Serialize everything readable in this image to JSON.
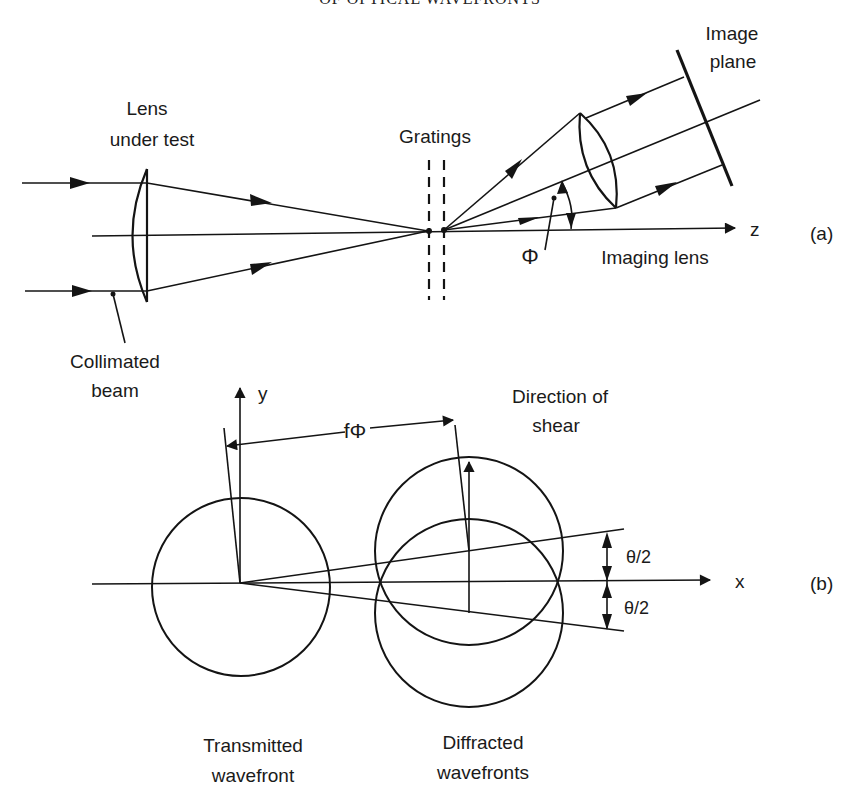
{
  "header": {
    "text": "OF OPTICAL WAVEFRONTS"
  },
  "part_a": {
    "panel_label": "(a)",
    "labels": {
      "lens_under_test_line1": "Lens",
      "lens_under_test_line2": "under test",
      "gratings": "Gratings",
      "image_plane_line1": "Image",
      "image_plane_line2": "plane",
      "axis_z": "z",
      "phi": "Φ",
      "imaging_lens": "Imaging lens",
      "collimated_beam_line1": "Collimated",
      "collimated_beam_line2": "beam"
    }
  },
  "part_b": {
    "panel_label": "(b)",
    "labels": {
      "axis_y": "y",
      "axis_x": "x",
      "f_phi": "fΦ",
      "direction_of_shear_line1": "Direction of",
      "direction_of_shear_line2": "shear",
      "theta_half_upper": "θ/2",
      "theta_half_lower": "θ/2",
      "transmitted_line1": "Transmitted",
      "transmitted_line2": "wavefront",
      "diffracted_line1": "Diffracted",
      "diffracted_line2": "wavefronts"
    }
  },
  "colors": {
    "ink": "#141414",
    "background": "#ffffff"
  }
}
